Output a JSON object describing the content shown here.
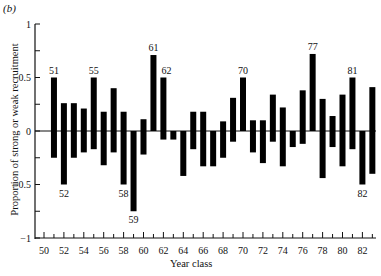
{
  "chart_data": {
    "type": "bar",
    "panel_label": "(b)",
    "title": "",
    "xlabel": "Year class",
    "ylabel": "Proportion of strong or weak recruitment",
    "ylim": [
      -1,
      1
    ],
    "xlim": [
      50,
      83
    ],
    "grid": false,
    "legend": null,
    "y_ticks": [
      -1,
      -0.5,
      0,
      0.5,
      1
    ],
    "y_tick_labels": [
      "−1",
      "−0.5",
      "0",
      "0.5",
      "1"
    ],
    "x_ticks": [
      50,
      52,
      54,
      56,
      58,
      60,
      62,
      64,
      66,
      68,
      70,
      72,
      74,
      76,
      78,
      80,
      82
    ],
    "x_tick_labels": [
      "50",
      "52",
      "54",
      "56",
      "58",
      "60",
      "62",
      "64",
      "66",
      "68",
      "70",
      "72",
      "74",
      "76",
      "78",
      "80",
      "82"
    ],
    "categories": [
      51,
      52,
      53,
      54,
      55,
      56,
      57,
      58,
      59,
      60,
      61,
      62,
      63,
      64,
      65,
      66,
      67,
      68,
      69,
      70,
      71,
      72,
      73,
      74,
      75,
      76,
      77,
      78,
      79,
      80,
      81,
      82,
      83
    ],
    "series": [
      {
        "name": "Strong recruitment (positive)",
        "values": [
          0.5,
          0.26,
          0.26,
          0.21,
          0.5,
          0.18,
          0.4,
          0.18,
          0.0,
          0.11,
          0.71,
          0.5,
          0.0,
          0.0,
          0.18,
          0.18,
          0.0,
          0.09,
          0.31,
          0.5,
          0.1,
          0.1,
          0.34,
          0.22,
          0.0,
          0.38,
          0.72,
          0.3,
          0.14,
          0.34,
          0.5,
          0.0,
          0.41
        ]
      },
      {
        "name": "Weak recruitment (negative)",
        "values": [
          -0.25,
          -0.5,
          -0.25,
          -0.2,
          -0.17,
          -0.32,
          -0.2,
          -0.5,
          -0.75,
          -0.22,
          0.0,
          -0.08,
          -0.08,
          -0.42,
          -0.17,
          -0.33,
          -0.33,
          -0.25,
          -0.1,
          0.0,
          -0.2,
          -0.3,
          -0.1,
          -0.33,
          -0.15,
          -0.12,
          0.0,
          -0.44,
          -0.15,
          -0.33,
          -0.17,
          -0.5,
          -0.4
        ]
      }
    ],
    "annotations": [
      {
        "year": 51,
        "label": "51",
        "position": "above"
      },
      {
        "year": 52,
        "label": "52",
        "position": "below"
      },
      {
        "year": 55,
        "label": "55",
        "position": "above"
      },
      {
        "year": 58,
        "label": "58",
        "position": "below"
      },
      {
        "year": 59,
        "label": "59",
        "position": "below"
      },
      {
        "year": 61,
        "label": "61",
        "position": "above"
      },
      {
        "year": 62,
        "label": "62",
        "position": "above"
      },
      {
        "year": 70,
        "label": "70",
        "position": "above"
      },
      {
        "year": 77,
        "label": "77",
        "position": "above"
      },
      {
        "year": 81,
        "label": "81",
        "position": "above"
      },
      {
        "year": 82,
        "label": "82",
        "position": "below"
      }
    ],
    "colors": {
      "bar": "#000000",
      "axis": "#111111"
    }
  }
}
